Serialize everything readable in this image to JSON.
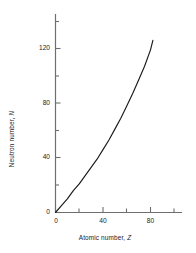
{
  "chart_data": {
    "type": "line",
    "title": "",
    "xlabel": "Atomic number, Z",
    "xlabel_text": "Atomic number, ",
    "xlabel_symbol": "Z",
    "ylabel": "Neutron number, N",
    "ylabel_text": "Neutron number, ",
    "ylabel_symbol": "N",
    "xlim": [
      0,
      107
    ],
    "ylim": [
      0,
      145
    ],
    "xticks": [
      0,
      20,
      40,
      60,
      80,
      100
    ],
    "xtick_labels": [
      "0",
      "",
      "40",
      "",
      "80",
      ""
    ],
    "yticks": [
      0,
      20,
      40,
      60,
      80,
      100,
      120,
      140
    ],
    "ytick_labels": [
      "0",
      "",
      "40",
      "",
      "80",
      "",
      "120",
      ""
    ],
    "grid": false,
    "legend": false,
    "line_color": "#1a1a1a",
    "axis_color": "#6e6e6e",
    "series": [
      {
        "name": "Line of stability (N vs Z)",
        "x": [
          0,
          5,
          10,
          15,
          20,
          25,
          30,
          35,
          40,
          45,
          50,
          55,
          60,
          65,
          70,
          75,
          80,
          82
        ],
        "values": [
          0,
          5,
          10,
          16,
          21,
          27,
          33,
          39,
          46,
          53,
          61,
          69,
          78,
          87,
          97,
          107,
          119,
          126
        ]
      }
    ]
  },
  "ylabel_tick_0": "0",
  "ylabel_tick_40": "40",
  "ylabel_tick_80": "80",
  "ylabel_tick_120": "120",
  "xlabel_tick_0": "0",
  "xlabel_tick_40": "40",
  "xlabel_tick_80": "80"
}
